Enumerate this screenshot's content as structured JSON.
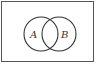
{
  "diagram": {
    "type": "venn",
    "universe": {
      "label": ""
    },
    "sets": [
      {
        "label": "A"
      },
      {
        "label": "B"
      }
    ],
    "colors": {
      "background": "#ffffff",
      "stroke": "#333333",
      "border": "#555555"
    }
  }
}
